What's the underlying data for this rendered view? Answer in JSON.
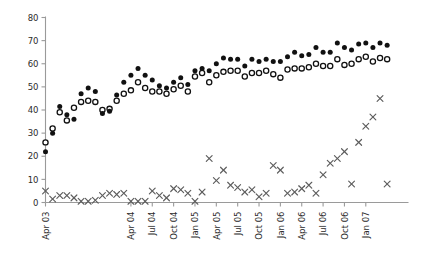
{
  "chart_data": {
    "type": "scatter",
    "title": "",
    "subtitle": "",
    "xlabel": "",
    "ylabel": "",
    "ylim": [
      0,
      80
    ],
    "yticks": [
      0,
      10,
      20,
      30,
      40,
      50,
      60,
      70,
      80
    ],
    "grid": false,
    "legend": "none",
    "xlim_months": [
      "Apr 03",
      "Jul 07"
    ],
    "xticks": [
      "Apr 03",
      "Apr 04",
      "Jul 04",
      "Oct 04",
      "Jan 05",
      "Apr 05",
      "Jul 05",
      "Oct 05",
      "Jan 06",
      "Apr 06",
      "Jul 06",
      "Oct 06",
      "Jan 07"
    ],
    "xtick_month_index": [
      0,
      12,
      15,
      18,
      21,
      24,
      27,
      30,
      33,
      36,
      39,
      42,
      45
    ],
    "x": [
      "Apr 03",
      "May 03",
      "Jun 03",
      "Jul 03",
      "Aug 03",
      "Sep 03",
      "Oct 03",
      "Nov 03",
      "Dec 03",
      "Jan 04",
      "Feb 04",
      "Mar 04",
      "Apr 04",
      "May 04",
      "Jun 04",
      "Jul 04",
      "Aug 04",
      "Sep 04",
      "Oct 04",
      "Nov 04",
      "Dec 04",
      "Jan 05",
      "Feb 05",
      "Mar 05",
      "Apr 05",
      "May 05",
      "Jun 05",
      "Jul 05",
      "Aug 05",
      "Sep 05",
      "Oct 05",
      "Nov 05",
      "Dec 05",
      "Jan 06",
      "Feb 06",
      "Mar 06",
      "Apr 06",
      "May 06",
      "Jun 06",
      "Jul 06",
      "Aug 06",
      "Sep 06",
      "Oct 06",
      "Nov 06",
      "Dec 06",
      "Jan 07",
      "Feb 07",
      "Mar 07",
      "Apr 07"
    ],
    "series": [
      {
        "name": "filled-circle",
        "marker": "filled circle",
        "color": "#111111",
        "values": [
          22,
          30,
          41.5,
          38,
          36,
          47,
          49.5,
          48,
          38.5,
          39.5,
          46.5,
          52,
          55,
          58,
          55,
          53,
          50.5,
          49.5,
          52,
          54,
          51,
          57,
          58,
          57,
          60,
          62.5,
          62,
          62,
          59,
          62,
          61,
          62,
          61,
          61,
          63,
          65,
          63.5,
          64,
          67,
          65,
          65,
          69,
          67,
          66,
          68.5,
          69,
          67,
          69,
          68
        ]
      },
      {
        "name": "open-circle",
        "marker": "open circle",
        "color": "#ffffff",
        "values": [
          26,
          32,
          39,
          35.5,
          41,
          43.5,
          44,
          43.5,
          40,
          40.5,
          44,
          47,
          48.5,
          52,
          49.5,
          48,
          48,
          47,
          49,
          50.5,
          48,
          54.5,
          56,
          52,
          55,
          56.5,
          57,
          57,
          54.5,
          56,
          56,
          57,
          55.5,
          54,
          57.5,
          58,
          58,
          58.5,
          60,
          59,
          59,
          62,
          59.5,
          60,
          62,
          63,
          61,
          62.5,
          62
        ]
      },
      {
        "name": "cross",
        "marker": "x",
        "color": "#5d5d5d",
        "values": [
          5,
          1.5,
          3,
          3,
          2,
          0.5,
          0.5,
          1,
          3,
          4,
          3.5,
          4,
          0.5,
          0.5,
          0.5,
          5,
          3,
          2,
          6,
          5.5,
          4,
          0.5,
          4.5,
          19,
          9.5,
          14,
          7.5,
          6.5,
          4.5,
          5.5,
          2.5,
          4,
          16,
          14,
          4,
          4.5,
          6,
          7.5,
          4,
          12,
          17,
          19,
          22,
          8,
          26,
          33,
          37,
          45,
          8
        ]
      }
    ]
  },
  "axes": {
    "y_tick_labels": [
      "0",
      "10",
      "20",
      "30",
      "40",
      "50",
      "60",
      "70",
      "80"
    ],
    "x_tick_labels": [
      "Apr 03",
      "Apr 04",
      "Jul 04",
      "Oct 04",
      "Jan 05",
      "Apr 05",
      "Jul 05",
      "Oct 05",
      "Jan 06",
      "Apr 06",
      "Jul 06",
      "Oct 06",
      "Jan 07"
    ]
  },
  "style": {
    "axis_color": "#9a9a9a",
    "filled_color": "#111111",
    "open_stroke_color": "#111111",
    "cross_color": "#5d5d5d",
    "background": "#ffffff"
  }
}
